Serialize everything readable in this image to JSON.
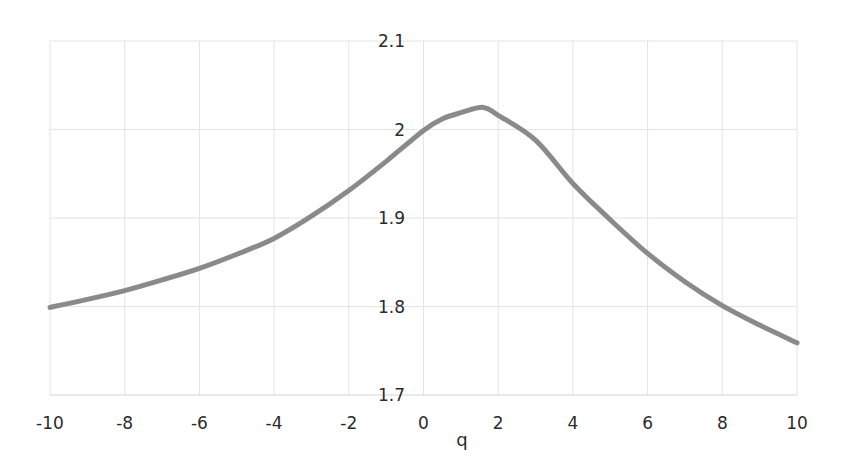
{
  "chart_data": {
    "type": "line",
    "title": "",
    "xlabel": "q",
    "ylabel": "",
    "xlim": [
      -10,
      10
    ],
    "ylim": [
      1.7,
      2.1
    ],
    "x_ticks": [
      "-10",
      "-8",
      "-6",
      "-4",
      "-2",
      "0",
      "2",
      "4",
      "6",
      "8",
      "10"
    ],
    "y_ticks": [
      "1.7",
      "1.8",
      "1.9",
      "2",
      "2.1"
    ],
    "grid": true,
    "legend": null,
    "series": [
      {
        "name": "curve",
        "color": "#8a8a8a",
        "x": [
          -10,
          -9,
          -8,
          -7,
          -6,
          -5,
          -4,
          -3,
          -2,
          -1,
          0,
          0.5,
          1,
          1.6,
          2,
          3,
          4,
          5,
          6,
          7,
          8,
          9,
          10
        ],
        "values": [
          1.799,
          1.808,
          1.818,
          1.83,
          1.843,
          1.859,
          1.877,
          1.902,
          1.931,
          1.964,
          1.999,
          2.012,
          2.019,
          2.025,
          2.016,
          1.988,
          1.939,
          1.898,
          1.86,
          1.828,
          1.801,
          1.779,
          1.759
        ]
      }
    ]
  },
  "colors": {
    "grid": "#e4e4e4",
    "text": "#2b2b2b",
    "line": "#8a8a8a"
  }
}
